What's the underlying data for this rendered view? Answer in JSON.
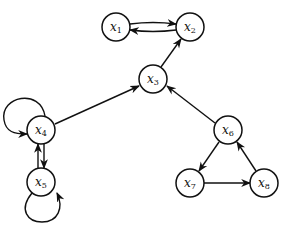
{
  "diagram": {
    "type": "directed-graph",
    "nodes": [
      {
        "id": "x1",
        "base": "x",
        "sub": "1",
        "cx": 116,
        "cy": 27
      },
      {
        "id": "x2",
        "base": "x",
        "sub": "2",
        "cx": 190,
        "cy": 27
      },
      {
        "id": "x3",
        "base": "x",
        "sub": "3",
        "cx": 153,
        "cy": 79
      },
      {
        "id": "x4",
        "base": "x",
        "sub": "4",
        "cx": 41,
        "cy": 130
      },
      {
        "id": "x5",
        "base": "x",
        "sub": "5",
        "cx": 41,
        "cy": 182
      },
      {
        "id": "x6",
        "base": "x",
        "sub": "6",
        "cx": 228,
        "cy": 130
      },
      {
        "id": "x7",
        "base": "x",
        "sub": "7",
        "cx": 190,
        "cy": 183
      },
      {
        "id": "x8",
        "base": "x",
        "sub": "8",
        "cx": 264,
        "cy": 183
      }
    ],
    "edges": [
      {
        "from": "x1",
        "to": "x2"
      },
      {
        "from": "x2",
        "to": "x1"
      },
      {
        "from": "x3",
        "to": "x2"
      },
      {
        "from": "x4",
        "to": "x3"
      },
      {
        "from": "x6",
        "to": "x3"
      },
      {
        "from": "x4",
        "to": "x4",
        "self_loop": true
      },
      {
        "from": "x4",
        "to": "x5"
      },
      {
        "from": "x5",
        "to": "x4"
      },
      {
        "from": "x5",
        "to": "x5",
        "self_loop": true
      },
      {
        "from": "x6",
        "to": "x7"
      },
      {
        "from": "x7",
        "to": "x8"
      },
      {
        "from": "x8",
        "to": "x6"
      }
    ],
    "colors": {
      "stroke": "#111111",
      "background": "#ffffff"
    }
  }
}
